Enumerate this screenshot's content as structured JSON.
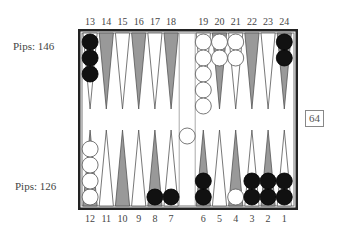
{
  "players": {
    "top": {
      "pips_label": "Pips: 146"
    },
    "bottom": {
      "pips_label": "Pips: 126"
    }
  },
  "cube": {
    "value": "64"
  },
  "point_labels": {
    "top": [
      "13",
      "14",
      "15",
      "16",
      "17",
      "18",
      "19",
      "20",
      "21",
      "22",
      "23",
      "24"
    ],
    "bottom": [
      "12",
      "11",
      "10",
      "9",
      "8",
      "7",
      "6",
      "5",
      "4",
      "3",
      "2",
      "1"
    ]
  },
  "colors": {
    "frame": "#222222",
    "dark_point": "#999999",
    "light_point": "#ffffff",
    "black_checker": "#111111",
    "white_checker": "#ffffff"
  },
  "position": {
    "top_row": [
      {
        "point": 13,
        "color": "black",
        "count": 3
      },
      {
        "point": 14,
        "color": null,
        "count": 0
      },
      {
        "point": 15,
        "color": null,
        "count": 0
      },
      {
        "point": 16,
        "color": null,
        "count": 0
      },
      {
        "point": 17,
        "color": null,
        "count": 0
      },
      {
        "point": 18,
        "color": null,
        "count": 0
      },
      {
        "point": 19,
        "color": "white",
        "count": 5
      },
      {
        "point": 20,
        "color": "white",
        "count": 2
      },
      {
        "point": 21,
        "color": "white",
        "count": 2
      },
      {
        "point": 22,
        "color": null,
        "count": 0
      },
      {
        "point": 23,
        "color": null,
        "count": 0
      },
      {
        "point": 24,
        "color": "black",
        "count": 2
      }
    ],
    "bottom_row": [
      {
        "point": 12,
        "color": "white",
        "count": 4
      },
      {
        "point": 11,
        "color": null,
        "count": 0
      },
      {
        "point": 10,
        "color": null,
        "count": 0
      },
      {
        "point": 9,
        "color": null,
        "count": 0
      },
      {
        "point": 8,
        "color": "black",
        "count": 1
      },
      {
        "point": 7,
        "color": "black",
        "count": 1
      },
      {
        "point": 6,
        "color": "black",
        "count": 2
      },
      {
        "point": 5,
        "color": null,
        "count": 0
      },
      {
        "point": 4,
        "color": "white",
        "count": 1
      },
      {
        "point": 3,
        "color": "black",
        "count": 2
      },
      {
        "point": 2,
        "color": "black",
        "count": 2
      },
      {
        "point": 1,
        "color": "black",
        "count": 2
      }
    ],
    "bar": [
      {
        "color": "white",
        "count": 1
      }
    ]
  }
}
